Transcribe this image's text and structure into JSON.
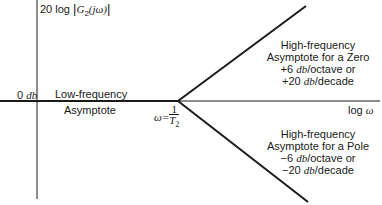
{
  "diagram": {
    "y_axis_label_prefix": "20 log ",
    "y_axis_label_fn": "G",
    "y_axis_label_sub": "2",
    "y_axis_label_arg": "(jω)",
    "x_axis_label_prefix": "log ",
    "x_axis_label_var": "ω",
    "zero_db_num": "0 ",
    "zero_db_unit": "db",
    "low_freq": {
      "line1": "Low-frequency",
      "line2": "Asymptote"
    },
    "breakpoint": {
      "lhs": "ω=",
      "num": "1",
      "den": "T",
      "den_sub": "2"
    },
    "zero_asymptote": {
      "line1": "High-frequency",
      "line2": "Asymptote for a Zero",
      "line3_prefix": "+6 ",
      "line3_unit": "db",
      "line3_suffix": "/octave or",
      "line4_prefix": "+20 ",
      "line4_unit": "db",
      "line4_suffix": "/decade"
    },
    "pole_asymptote": {
      "line1": "High-frequency",
      "line2": "Asymptote for a Pole",
      "line3_prefix": "−6 ",
      "line3_unit": "db",
      "line3_suffix": "/octave or",
      "line4_prefix": "−20 ",
      "line4_unit": "db",
      "line4_suffix": "/decade"
    },
    "colors": {
      "ink": "#1a1a1a",
      "background": "#ffffff"
    }
  }
}
